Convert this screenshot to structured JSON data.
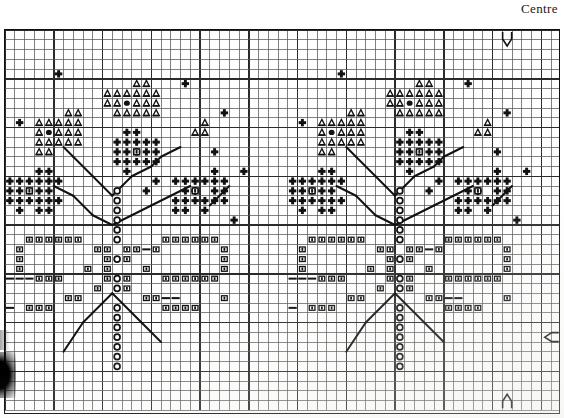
{
  "page": {
    "centre_label": "Centre",
    "background_color": "#ffffff",
    "ink_color": "#111111"
  },
  "chart": {
    "type": "cross-stitch-grid",
    "columns": 57,
    "rows": 39,
    "cell_size_px": 9.75,
    "bold_line_every": 5,
    "grid_line_color": "#2b2b2b",
    "thin_line_color": "#555555",
    "frame_border_color": "#111111",
    "origin_px": {
      "x": 4,
      "y": 29
    },
    "size_px": {
      "width": 556,
      "height": 385
    }
  },
  "legend_symbols": [
    {
      "key": "triangle",
      "name": "triangle-stitch",
      "glyph": "△"
    },
    {
      "key": "cross",
      "name": "cross-stitch",
      "glyph": "✛"
    },
    {
      "key": "open_circle",
      "name": "open-circle-stitch",
      "glyph": "○"
    },
    {
      "key": "filled_circle",
      "name": "filled-circle-stitch",
      "glyph": "●"
    },
    {
      "key": "square",
      "name": "square-stitch",
      "glyph": "▣"
    }
  ],
  "edge_markers": [
    {
      "name": "centre-arrow-top",
      "direction": "down",
      "col": 51,
      "side": "top"
    },
    {
      "name": "centre-arrow-right",
      "direction": "left",
      "row": 31,
      "side": "right"
    },
    {
      "name": "centre-arrow-bottom",
      "direction": "up",
      "col": 51,
      "side": "bottom"
    }
  ],
  "motifs": {
    "count": 2,
    "description": "Two identical floral sprays repeated across the chart",
    "repeat_offset_columns": 29
  },
  "chart_data": {
    "type": "heatmap",
    "xlabel": "",
    "ylabel": "",
    "grid": true,
    "legend_position": "none",
    "motif_offsets": [
      0,
      29
    ],
    "symbol_cells": {
      "triangle": [
        [
          13,
          5
        ],
        [
          14,
          5
        ],
        [
          10,
          6
        ],
        [
          11,
          6
        ],
        [
          12,
          6
        ],
        [
          13,
          6
        ],
        [
          14,
          6
        ],
        [
          15,
          6
        ],
        [
          10,
          7
        ],
        [
          11,
          7
        ],
        [
          13,
          7
        ],
        [
          14,
          7
        ],
        [
          15,
          7
        ],
        [
          6,
          8
        ],
        [
          7,
          8
        ],
        [
          11,
          8
        ],
        [
          12,
          8
        ],
        [
          13,
          8
        ],
        [
          14,
          8
        ],
        [
          15,
          8
        ],
        [
          3,
          9
        ],
        [
          4,
          9
        ],
        [
          5,
          9
        ],
        [
          6,
          9
        ],
        [
          7,
          9
        ],
        [
          20,
          9
        ],
        [
          3,
          10
        ],
        [
          5,
          10
        ],
        [
          6,
          10
        ],
        [
          7,
          10
        ],
        [
          19,
          10
        ],
        [
          20,
          10
        ],
        [
          3,
          11
        ],
        [
          4,
          11
        ],
        [
          5,
          11
        ],
        [
          6,
          11
        ],
        [
          7,
          11
        ],
        [
          3,
          12
        ],
        [
          4,
          12
        ]
      ],
      "filled_circle": [
        [
          12,
          7
        ],
        [
          4,
          10
        ]
      ],
      "cross": [
        [
          5,
          4
        ],
        [
          18,
          5
        ],
        [
          22,
          8
        ],
        [
          1,
          9
        ],
        [
          12,
          10
        ],
        [
          13,
          10
        ],
        [
          11,
          11
        ],
        [
          12,
          11
        ],
        [
          13,
          11
        ],
        [
          14,
          11
        ],
        [
          15,
          11
        ],
        [
          11,
          12
        ],
        [
          12,
          12
        ],
        [
          14,
          12
        ],
        [
          15,
          12
        ],
        [
          21,
          12
        ],
        [
          11,
          13
        ],
        [
          12,
          13
        ],
        [
          13,
          13
        ],
        [
          14,
          13
        ],
        [
          15,
          13
        ],
        [
          12,
          14
        ],
        [
          3,
          14
        ],
        [
          4,
          14
        ],
        [
          21,
          14
        ],
        [
          24,
          14
        ],
        [
          0,
          15
        ],
        [
          1,
          15
        ],
        [
          2,
          15
        ],
        [
          3,
          15
        ],
        [
          4,
          15
        ],
        [
          5,
          15
        ],
        [
          15,
          15
        ],
        [
          17,
          15
        ],
        [
          18,
          15
        ],
        [
          19,
          15
        ],
        [
          20,
          15
        ],
        [
          21,
          15
        ],
        [
          22,
          15
        ],
        [
          0,
          16
        ],
        [
          1,
          16
        ],
        [
          3,
          16
        ],
        [
          4,
          16
        ],
        [
          14,
          16
        ],
        [
          18,
          16
        ],
        [
          19,
          16
        ],
        [
          21,
          16
        ],
        [
          22,
          16
        ],
        [
          0,
          17
        ],
        [
          1,
          17
        ],
        [
          2,
          17
        ],
        [
          3,
          17
        ],
        [
          4,
          17
        ],
        [
          5,
          17
        ],
        [
          17,
          17
        ],
        [
          18,
          17
        ],
        [
          19,
          17
        ],
        [
          20,
          17
        ],
        [
          21,
          17
        ],
        [
          22,
          17
        ],
        [
          1,
          18
        ],
        [
          3,
          18
        ],
        [
          4,
          18
        ],
        [
          17,
          18
        ],
        [
          18,
          18
        ],
        [
          20,
          18
        ],
        [
          23,
          19
        ]
      ],
      "cross_inner_square": [
        [
          13,
          12
        ],
        [
          2,
          16
        ],
        [
          19,
          16
        ]
      ],
      "open_circle": [
        [
          11,
          16
        ],
        [
          11,
          17
        ],
        [
          11,
          18
        ],
        [
          11,
          19
        ],
        [
          11,
          20
        ],
        [
          11,
          21
        ],
        [
          11,
          23
        ],
        [
          11,
          25
        ],
        [
          11,
          26
        ],
        [
          11,
          28
        ],
        [
          11,
          29
        ],
        [
          11,
          30
        ],
        [
          11,
          31
        ],
        [
          11,
          32
        ],
        [
          11,
          33
        ],
        [
          11,
          34
        ]
      ],
      "square": [
        [
          2,
          21
        ],
        [
          3,
          21
        ],
        [
          4,
          21
        ],
        [
          5,
          21
        ],
        [
          6,
          21
        ],
        [
          7,
          21
        ],
        [
          16,
          21
        ],
        [
          17,
          21
        ],
        [
          18,
          21
        ],
        [
          19,
          21
        ],
        [
          20,
          21
        ],
        [
          21,
          21
        ],
        [
          1,
          22
        ],
        [
          9,
          22
        ],
        [
          10,
          22
        ],
        [
          12,
          22
        ],
        [
          13,
          22
        ],
        [
          15,
          22
        ],
        [
          22,
          22
        ],
        [
          1,
          23
        ],
        [
          10,
          23
        ],
        [
          12,
          23
        ],
        [
          22,
          23
        ],
        [
          1,
          24
        ],
        [
          8,
          24
        ],
        [
          10,
          24
        ],
        [
          14,
          24
        ],
        [
          22,
          24
        ],
        [
          3,
          25
        ],
        [
          4,
          25
        ],
        [
          5,
          25
        ],
        [
          10,
          25
        ],
        [
          12,
          25
        ],
        [
          16,
          25
        ],
        [
          17,
          25
        ],
        [
          18,
          25
        ],
        [
          19,
          25
        ],
        [
          20,
          25
        ],
        [
          21,
          25
        ],
        [
          9,
          26
        ],
        [
          12,
          26
        ],
        [
          6,
          27
        ],
        [
          7,
          27
        ],
        [
          14,
          27
        ],
        [
          15,
          27
        ],
        [
          22,
          27
        ],
        [
          2,
          28
        ],
        [
          3,
          28
        ],
        [
          4,
          28
        ],
        [
          16,
          28
        ],
        [
          17,
          28
        ],
        [
          18,
          28
        ],
        [
          19,
          28
        ]
      ],
      "dash_marks": [
        [
          14,
          22
        ],
        [
          0,
          25
        ],
        [
          1,
          25
        ],
        [
          2,
          25
        ],
        [
          16,
          27
        ],
        [
          17,
          27
        ],
        [
          0,
          28
        ]
      ]
    },
    "backstitch_lines": [
      [
        [
          6,
          12
        ],
        [
          7,
          13
        ]
      ],
      [
        [
          7,
          13
        ],
        [
          9,
          15
        ]
      ],
      [
        [
          9,
          15
        ],
        [
          10,
          16
        ]
      ],
      [
        [
          10,
          16
        ],
        [
          11,
          17
        ]
      ],
      [
        [
          11,
          17
        ],
        [
          12,
          16
        ]
      ],
      [
        [
          12,
          16
        ],
        [
          13,
          15
        ]
      ],
      [
        [
          13,
          15
        ],
        [
          15,
          14
        ]
      ],
      [
        [
          15,
          14
        ],
        [
          16,
          13
        ]
      ],
      [
        [
          16,
          13
        ],
        [
          18,
          12
        ]
      ],
      [
        [
          5,
          16
        ],
        [
          7,
          17
        ]
      ],
      [
        [
          7,
          17
        ],
        [
          9,
          19
        ]
      ],
      [
        [
          9,
          19
        ],
        [
          11,
          20
        ]
      ],
      [
        [
          11,
          20
        ],
        [
          13,
          19
        ]
      ],
      [
        [
          13,
          19
        ],
        [
          15,
          18
        ]
      ],
      [
        [
          15,
          18
        ],
        [
          17,
          17
        ]
      ],
      [
        [
          17,
          17
        ],
        [
          19,
          16
        ]
      ],
      [
        [
          23,
          16
        ],
        [
          21,
          18
        ]
      ],
      [
        [
          11,
          27
        ],
        [
          8,
          30
        ]
      ],
      [
        [
          8,
          30
        ],
        [
          6,
          33
        ]
      ],
      [
        [
          11,
          27
        ],
        [
          14,
          30
        ]
      ],
      [
        [
          14,
          30
        ],
        [
          16,
          32
        ]
      ]
    ],
    "note": "Each listed [col,row] cell is repeated at +29 columns for the second motif"
  }
}
